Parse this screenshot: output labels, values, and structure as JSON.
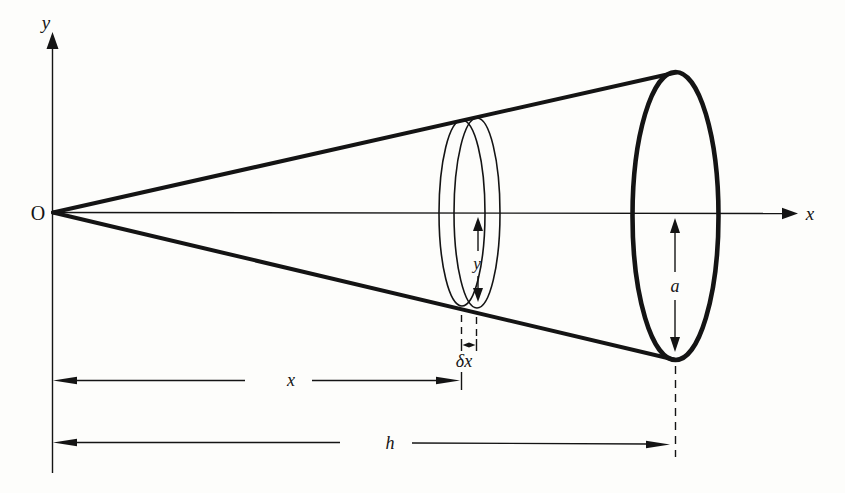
{
  "figure": {
    "background_color": "#fdfdfb",
    "ink_color": "#141414"
  },
  "axes": {
    "origin_label": "O",
    "x_axis_label": "x",
    "y_axis_label": "y"
  },
  "cone": {
    "base_radius_label": "a",
    "height_label": "h"
  },
  "disc": {
    "radius_label": "y",
    "thickness_label": "δx",
    "distance_label": "x"
  }
}
